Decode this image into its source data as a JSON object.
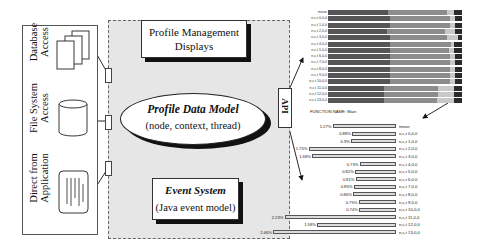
{
  "left_panel": {
    "items": [
      {
        "label_line1": "Database",
        "label_line2": "Access",
        "icon": "stacked-documents-icon"
      },
      {
        "label_line1": "File System",
        "label_line2": "Access",
        "icon": "disk-cylinder-icon"
      },
      {
        "label_line1": "Direct from",
        "label_line2": "Application",
        "icon": "text-document-icon"
      }
    ]
  },
  "core": {
    "displays": {
      "line1": "Profile Management",
      "line2": "Displays"
    },
    "data_model": {
      "title": "Profile Data Model",
      "subtitle": "(node, context, thread)"
    },
    "event_system": {
      "title": "Event System",
      "subtitle": "(Java event model)"
    },
    "api_label": "API"
  },
  "function_name_label": "FUNCTION NAME: Main",
  "chart_data": [
    {
      "type": "bar",
      "stacked": true,
      "orientation": "horizontal",
      "title": "",
      "categories": [
        "mean",
        "n,c,t 0,0,0",
        "n,c,t 1,0,0",
        "n,c,t 2,0,0",
        "n,c,t 3,0,0",
        "n,c,t 4,0,0",
        "n,c,t 5,0,0",
        "n,c,t 6,0,0",
        "n,c,t 7,0,0",
        "n,c,t 8,0,0",
        "n,c,t 9,0,0",
        "n,c,t 10,0,0",
        "n,c,t 11,0,0",
        "n,c,t 12,0,0",
        "n,c,t 13,0,0"
      ],
      "series": [
        {
          "name": "segment-1 (dark)",
          "color": "#555555",
          "values": [
            45,
            46,
            46,
            44,
            46,
            46,
            46,
            46,
            46,
            46,
            46,
            46,
            42,
            42,
            42
          ]
        },
        {
          "name": "segment-2 (mid gray)",
          "color": "#8c8c8c",
          "values": [
            44,
            45,
            45,
            43,
            43,
            46,
            44,
            45,
            45,
            45,
            45,
            45,
            40,
            40,
            39
          ]
        },
        {
          "name": "segment-3 (light)",
          "color": "#c8c8c8",
          "values": [
            5,
            4,
            4,
            8,
            8,
            2,
            4,
            4,
            4,
            4,
            4,
            4,
            12,
            12,
            13
          ]
        },
        {
          "name": "segment-4 (black)",
          "color": "#2a2a2a",
          "values": [
            6,
            5,
            5,
            5,
            3,
            6,
            6,
            5,
            5,
            5,
            5,
            5,
            6,
            6,
            6
          ]
        }
      ],
      "xlabel": "",
      "ylabel": ""
    },
    {
      "type": "bar",
      "orientation": "horizontal",
      "title": "FUNCTION NAME: Main",
      "categories": [
        "mean",
        "n,c,t 0,0,0",
        "n,c,t 1,0,0",
        "n,c,t 2,0,0",
        "n,c,t 3,0,0",
        "n,c,t 4,0,0",
        "n,c,t 5,0,0",
        "n,c,t 6,0,0",
        "n,c,t 7,0,0",
        "n,c,t 8,0,0",
        "n,c,t 9,0,0",
        "n,c,t 10,0,0",
        "n,c,t 11,0,0",
        "n,c,t 12,0,0",
        "n,c,t 13,0,0"
      ],
      "values": [
        1.27,
        0.88,
        0.9,
        1.75,
        1.68,
        0.73,
        0.82,
        0.81,
        0.85,
        0.86,
        0.75,
        0.74,
        2.23,
        1.58,
        2.46
      ],
      "value_labels": [
        "1.27%",
        "0.88%",
        "0.9%",
        "1.75%",
        "1.68%",
        "0.73%",
        "0.82%",
        "0.81%",
        "0.85%",
        "0.86%",
        "0.75%",
        "0.74%",
        "2.23%",
        "1.58%",
        "2.46%"
      ],
      "xlabel": "",
      "ylabel": "",
      "unit": "%"
    }
  ]
}
